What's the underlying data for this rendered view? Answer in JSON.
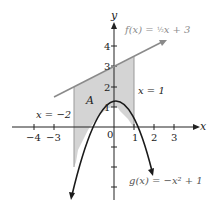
{
  "figure": {
    "type": "area-between-curves",
    "axis_labels": {
      "x": "x",
      "y": "y"
    },
    "x_ticks": [
      {
        "value": -4,
        "label": "−4"
      },
      {
        "value": -3,
        "label": "−3"
      },
      {
        "value": 0,
        "label": "0"
      },
      {
        "value": 1,
        "label": "1"
      },
      {
        "value": 2,
        "label": "2"
      },
      {
        "value": 3,
        "label": "3"
      }
    ],
    "y_ticks": [
      {
        "value": 1,
        "label": "1"
      },
      {
        "value": 2,
        "label": "2"
      },
      {
        "value": 3,
        "label": "3"
      },
      {
        "value": 4,
        "label": "4"
      }
    ],
    "curves": {
      "f": {
        "label": "f(x) = ½x + 3",
        "color": "#8a8a8a",
        "equation": "0.5*x + 3"
      },
      "g": {
        "label": "g(x) = −x² + 1",
        "color": "#1a1a1a",
        "equation": "-x^2 + 1"
      }
    },
    "bounds": {
      "left": {
        "label": "x = −2",
        "value": -2
      },
      "right": {
        "label": "x = 1",
        "value": 1
      }
    },
    "region": {
      "label": "A",
      "fill": "#d4d4d4"
    }
  }
}
